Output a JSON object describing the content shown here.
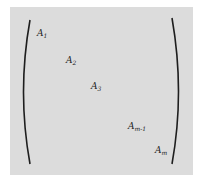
{
  "matrix": {
    "type": "block-diagonal",
    "background_color": "#dcdcdc",
    "bracket_color": "#1e1e1e",
    "entries": [
      {
        "base": "A",
        "sub": "1"
      },
      {
        "base": "A",
        "sub": "2"
      },
      {
        "base": "A",
        "sub": "3"
      },
      {
        "base": "A",
        "sub": "m-1"
      },
      {
        "base": "A",
        "sub": "m"
      }
    ]
  }
}
